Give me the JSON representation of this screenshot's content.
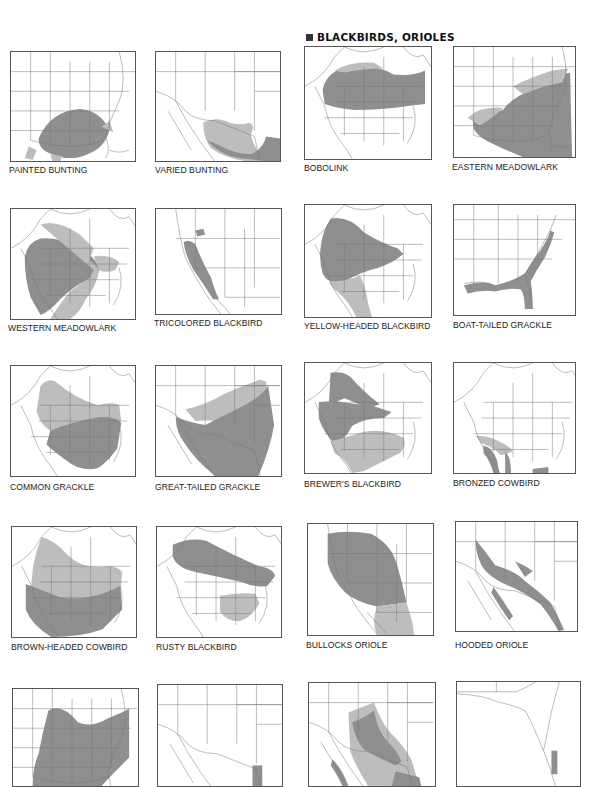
{
  "header": {
    "section_title": "BLACKBIRDS, ORIOLES",
    "bullet_icon": "square-bullet"
  },
  "legend_colors": {
    "year_round": "#8f8f8f",
    "breeding_or_winter": "#bdbdbd",
    "outline": "#444444",
    "background": "#ffffff"
  },
  "maps": [
    {
      "label": "PAINTED BUNTING",
      "x": 10,
      "y": 51,
      "w": 126,
      "h": 111,
      "lx": 9,
      "ly": 165,
      "view": "us-east",
      "ranges": [
        {
          "t": "mid",
          "d": "M28,88 Q40,60 70,58 Q92,60 100,80 Q95,98 78,104 Q60,112 42,104 Q28,100 28,88 Z"
        },
        {
          "t": "light",
          "d": "M92,76 L100,70 L104,82 Z"
        },
        {
          "t": "light",
          "d": "M18,96 L26,100 L22,110 L14,108 Z"
        },
        {
          "t": "light",
          "d": "M40,104 L52,106 L50,111 L42,111 Z"
        }
      ]
    },
    {
      "label": "VARIED BUNTING",
      "x": 155,
      "y": 51,
      "w": 126,
      "h": 111,
      "lx": 155,
      "ly": 165,
      "view": "southwest",
      "ranges": [
        {
          "t": "light",
          "d": "M48,72 Q60,66 70,70 Q84,76 94,72 Q102,74 96,84 Q100,98 110,111 L90,111 Q70,108 56,98 Q48,88 48,72 Z"
        },
        {
          "t": "mid",
          "d": "M52,90 Q64,104 84,108 L110,111 L126,111 L126,88 L112,86 Q108,100 96,104 Q80,104 62,94 Z"
        }
      ]
    },
    {
      "label": "BOBOLINK",
      "x": 304,
      "y": 46,
      "w": 128,
      "h": 114,
      "lx": 304,
      "ly": 163,
      "view": "north-america",
      "ranges": [
        {
          "t": "mid",
          "d": "M18,44 Q20,28 40,20 Q70,16 90,28 Q110,30 122,24 L122,58 Q104,60 90,62 Q70,64 50,64 Q30,62 20,58 Z"
        },
        {
          "t": "light",
          "d": "M30,24 Q46,14 70,16 L80,22 Q60,22 40,26 Z"
        }
      ]
    },
    {
      "label": "EASTERN MEADOWLARK",
      "x": 453,
      "y": 46,
      "w": 123,
      "h": 112,
      "lx": 452,
      "ly": 162,
      "view": "us-east",
      "ranges": [
        {
          "t": "mid",
          "d": "M50,64 Q60,50 80,44 Q98,30 118,26 L120,112 L70,112 Q50,104 34,96 Q16,86 20,74 Q34,70 50,64 Z"
        },
        {
          "t": "light",
          "d": "M14,72 Q26,60 50,62 Q40,72 26,80 Z"
        },
        {
          "t": "light",
          "d": "M60,40 Q80,30 100,24 L116,22 L110,36 Q90,40 70,48 Z"
        }
      ]
    },
    {
      "label": "WESTERN MEADOWLARK",
      "x": 10,
      "y": 208,
      "w": 126,
      "h": 112,
      "lx": 8,
      "ly": 323,
      "view": "north-america",
      "ranges": [
        {
          "t": "mid",
          "d": "M14,50 Q16,34 30,30 Q50,28 70,40 Q86,48 90,62 Q84,72 70,76 Q60,82 50,92 Q40,104 30,108 L20,90 Q14,72 14,50 Z"
        },
        {
          "t": "light",
          "d": "M30,16 Q46,10 70,26 L84,40 L80,52 L90,62 Q86,80 76,92 Q70,106 60,112 L40,112 Q50,96 60,84 Q70,76 80,70 L84,62 Z"
        },
        {
          "t": "light",
          "d": "M84,48 Q100,46 110,54 L106,62 Q96,66 90,62 Z"
        }
      ]
    },
    {
      "label": "TRICOLORED BLACKBIRD",
      "x": 155,
      "y": 208,
      "w": 127,
      "h": 107,
      "lx": 154,
      "ly": 318,
      "view": "west-coast",
      "ranges": [
        {
          "t": "mid",
          "d": "M28,34 Q34,30 40,36 Q48,56 56,70 Q60,84 64,92 L58,92 Q48,76 38,62 Q30,48 28,34 Z"
        },
        {
          "t": "mid",
          "d": "M40,22 L48,20 L50,26 L42,28 Z"
        }
      ]
    },
    {
      "label": "YELLOW-HEADED BLACKBIRD",
      "x": 304,
      "y": 204,
      "w": 128,
      "h": 114,
      "lx": 304,
      "ly": 321,
      "view": "north-america",
      "ranges": [
        {
          "t": "mid",
          "d": "M26,14 Q44,10 60,28 Q80,40 94,44 L100,50 Q88,60 74,64 Q56,68 40,78 Q24,82 18,70 Q14,56 16,42 Q18,26 26,14 Z"
        },
        {
          "t": "light",
          "d": "M24,78 Q40,78 56,72 Q62,84 64,100 L68,114 L52,114 Q44,96 30,86 Z"
        }
      ]
    },
    {
      "label": "BOAT-TAILED GRACKLE",
      "x": 453,
      "y": 204,
      "w": 123,
      "h": 112,
      "lx": 453,
      "ly": 320,
      "view": "us-southeast",
      "ranges": [
        {
          "t": "mid",
          "d": "M10,82 Q30,76 42,82 Q60,78 72,70 Q80,56 88,46 Q96,34 98,26 L102,28 Q98,42 92,54 Q84,66 78,78 Q80,90 80,106 L72,106 Q72,92 68,86 Q56,84 42,88 Q28,86 14,90 Z"
        }
      ]
    },
    {
      "label": "COMMON GRACKLE",
      "x": 10,
      "y": 365,
      "w": 126,
      "h": 112,
      "lx": 10,
      "ly": 482,
      "view": "north-america",
      "ranges": [
        {
          "t": "light",
          "d": "M30,20 Q40,10 48,18 Q64,32 88,40 Q104,36 110,40 L112,56 Q96,60 80,62 L40,66 Q30,60 26,46 Z"
        },
        {
          "t": "mid",
          "d": "M40,66 Q64,56 90,52 Q108,52 112,58 L108,84 Q96,100 88,104 Q70,108 56,96 Q42,86 36,80 Z"
        }
      ]
    },
    {
      "label": "GREAT-TAILED GRACKLE",
      "x": 155,
      "y": 365,
      "w": 127,
      "h": 112,
      "lx": 155,
      "ly": 482,
      "view": "southwest",
      "ranges": [
        {
          "t": "light",
          "d": "M30,44 Q50,40 70,28 Q88,20 106,14 L112,16 L116,60 Q100,70 80,60 Q60,54 40,56 Z"
        },
        {
          "t": "mid",
          "d": "M20,52 Q36,58 50,60 Q70,50 90,40 Q108,30 114,20 L120,60 Q116,84 104,112 L60,112 Q40,96 30,80 Q20,68 20,52 Z"
        }
      ]
    },
    {
      "label": "BREWER'S BLACKBIRD",
      "x": 304,
      "y": 362,
      "w": 128,
      "h": 112,
      "lx": 304,
      "ly": 479,
      "view": "north-america",
      "ranges": [
        {
          "t": "mid",
          "d": "M26,10 Q38,8 46,14 Q60,30 76,42 L64,46 Q50,40 40,36 Q30,40 24,46 Z"
        },
        {
          "t": "mid",
          "d": "M14,40 Q26,38 38,40 Q54,42 70,44 Q82,48 88,50 L80,56 Q60,56 48,64 Q40,80 30,82 Q18,70 14,56 Z"
        },
        {
          "t": "light",
          "d": "M26,80 Q40,76 60,70 Q80,66 100,76 Q104,84 96,92 Q80,100 60,110 L48,112 Q40,96 30,92 Z"
        }
      ]
    },
    {
      "label": "BRONZED COWBIRD",
      "x": 453,
      "y": 362,
      "w": 123,
      "h": 112,
      "lx": 453,
      "ly": 478,
      "view": "north-america",
      "ranges": [
        {
          "t": "light",
          "d": "M22,74 Q36,74 46,80 Q56,84 60,90 L48,94 Q38,84 28,82 Z"
        },
        {
          "t": "mid",
          "d": "M30,84 Q40,86 44,100 L46,112 L40,112 Q36,98 30,92 Z"
        },
        {
          "t": "mid",
          "d": "M52,90 Q58,96 58,112 L52,112 Z"
        },
        {
          "t": "mid",
          "d": "M80,108 L96,106 L96,112 L80,112 Z"
        }
      ]
    },
    {
      "label": "BROWN-HEADED COWBIRD",
      "x": 11,
      "y": 526,
      "w": 126,
      "h": 112,
      "lx": 11,
      "ly": 642,
      "view": "north-america",
      "ranges": [
        {
          "t": "light",
          "d": "M30,10 Q44,14 56,28 Q72,44 96,40 Q108,40 112,46 L110,66 Q90,72 70,74 Q40,76 20,70 Q18,40 30,10 Z"
        },
        {
          "t": "mid",
          "d": "M14,58 Q30,64 50,72 Q80,76 110,60 L112,84 Q100,96 92,104 Q70,112 40,112 Q20,100 14,84 Z"
        }
      ]
    },
    {
      "label": "RUSTY BLACKBIRD",
      "x": 156,
      "y": 526,
      "w": 126,
      "h": 112,
      "lx": 156,
      "ly": 642,
      "view": "north-america",
      "ranges": [
        {
          "t": "mid",
          "d": "M16,18 Q34,10 50,14 Q80,30 104,40 Q118,42 120,50 L112,60 Q100,62 86,56 Q60,50 40,46 Q20,42 16,30 Z"
        },
        {
          "t": "light",
          "d": "M64,70 Q84,66 100,68 L104,78 Q96,92 84,96 Q70,96 64,86 Z"
        }
      ]
    },
    {
      "label": "BULLOCKS ORIOLE",
      "x": 307,
      "y": 523,
      "w": 127,
      "h": 113,
      "lx": 306,
      "ly": 640,
      "view": "west-coast",
      "ranges": [
        {
          "t": "mid",
          "d": "M20,10 Q40,6 64,10 Q84,20 90,40 Q96,60 100,80 L70,84 Q50,80 38,70 Q24,56 20,40 Z"
        },
        {
          "t": "light",
          "d": "M70,84 L100,80 L106,100 L108,113 L70,113 Q64,100 70,84 Z"
        }
      ]
    },
    {
      "label": "HOODED ORIOLE",
      "x": 455,
      "y": 521,
      "w": 123,
      "h": 111,
      "lx": 455,
      "ly": 640,
      "view": "southwest",
      "ranges": [
        {
          "t": "mid",
          "d": "M20,18 Q30,30 40,44 Q60,50 70,60 Q84,70 96,82 Q104,96 110,110 L104,111 Q96,96 86,84 Q70,72 56,66 Q40,60 30,50 Q20,38 20,18 Z"
        },
        {
          "t": "mid",
          "d": "M38,66 Q48,80 58,96 L54,100 Q44,86 36,72 Z"
        },
        {
          "t": "mid",
          "d": "M60,40 Q70,44 78,50 L70,56 Z"
        }
      ]
    },
    {
      "label": "",
      "x": 12,
      "y": 688,
      "w": 127,
      "h": 99,
      "lx": 12,
      "ly": 787,
      "view": "us-east",
      "ranges": [
        {
          "t": "mid",
          "d": "M36,22 Q50,14 66,34 Q80,40 96,30 Q112,24 118,20 L118,70 Q100,88 90,99 L20,99 Q20,80 26,66 Q30,44 36,22 Z"
        }
      ]
    },
    {
      "label": "",
      "x": 157,
      "y": 684,
      "w": 126,
      "h": 103,
      "lx": 157,
      "ly": 787,
      "view": "southwest",
      "ranges": [
        {
          "t": "mid",
          "d": "M96,82 L106,82 L106,103 L96,103 Z"
        }
      ]
    },
    {
      "label": "",
      "x": 308,
      "y": 682,
      "w": 128,
      "h": 105,
      "lx": 308,
      "ly": 787,
      "view": "southwest",
      "ranges": [
        {
          "t": "light",
          "d": "M40,30 Q56,24 66,20 Q76,46 86,54 Q96,64 104,78 L112,105 L60,105 Q48,86 42,70 Z"
        },
        {
          "t": "mid",
          "d": "M44,40 Q56,36 66,28 Q70,50 80,60 Q90,70 94,80 L88,84 Q70,76 56,68 Q46,56 44,40 Z"
        },
        {
          "t": "mid",
          "d": "M24,78 Q34,88 40,105 L34,105 Q28,92 22,84 Z"
        },
        {
          "t": "mid",
          "d": "M88,90 L112,96 L114,105 L84,105 Z"
        }
      ]
    },
    {
      "label": "",
      "x": 456,
      "y": 681,
      "w": 125,
      "h": 106,
      "lx": 456,
      "ly": 787,
      "view": "florida",
      "ranges": [
        {
          "t": "mid",
          "d": "M96,70 L102,70 L102,94 L96,94 Z"
        }
      ]
    }
  ]
}
